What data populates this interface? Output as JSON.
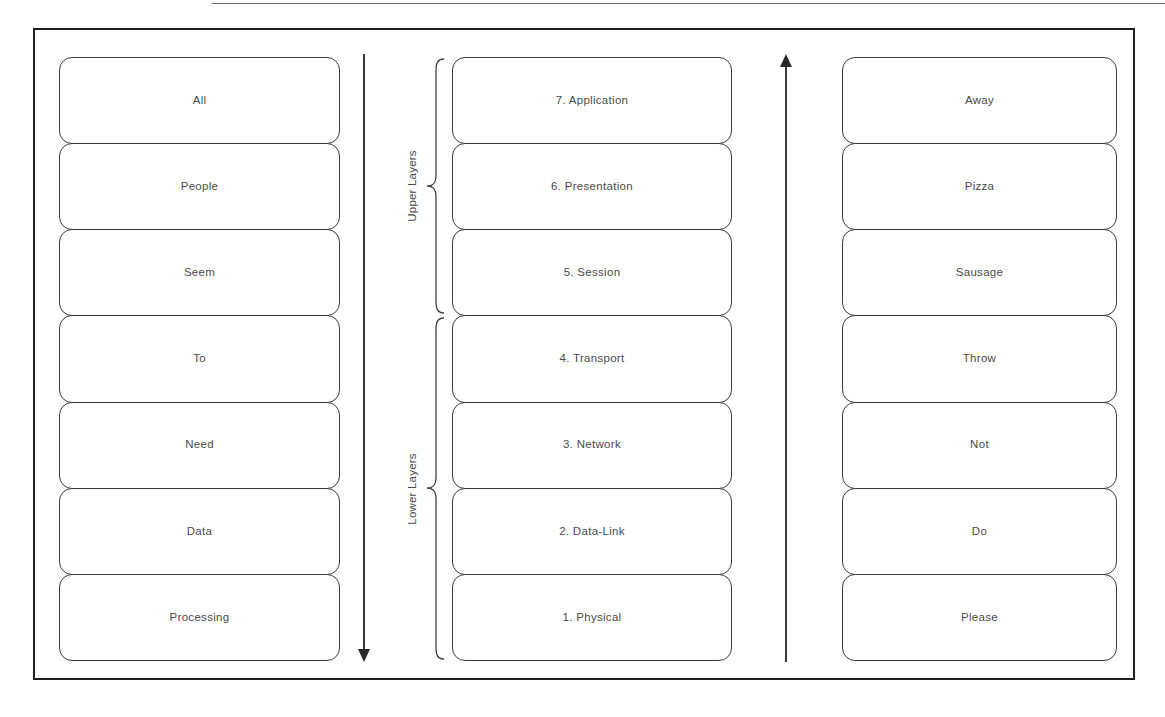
{
  "figure": {
    "type": "osi-model-mnemonic-diagram",
    "columns": {
      "left_mnemonic": {
        "name": "top-down-mnemonic",
        "items": [
          {
            "label": "All"
          },
          {
            "label": "People"
          },
          {
            "label": "Seem"
          },
          {
            "label": "To"
          },
          {
            "label": "Need"
          },
          {
            "label": "Data"
          },
          {
            "label": "Processing"
          }
        ]
      },
      "osi_layers": {
        "name": "osi-seven-layers",
        "items": [
          {
            "label": "7. Application"
          },
          {
            "label": "6. Presentation"
          },
          {
            "label": "5. Session"
          },
          {
            "label": "4. Transport"
          },
          {
            "label": "3. Network"
          },
          {
            "label": "2. Data-Link"
          },
          {
            "label": "1. Physical"
          }
        ]
      },
      "right_mnemonic": {
        "name": "bottom-up-mnemonic",
        "items": [
          {
            "label": "Away"
          },
          {
            "label": "Pizza"
          },
          {
            "label": "Sausage"
          },
          {
            "label": "Throw"
          },
          {
            "label": "Not"
          },
          {
            "label": "Do"
          },
          {
            "label": "Please"
          }
        ]
      }
    },
    "groups": [
      {
        "label": "Upper Layers",
        "covers": [
          "7. Application",
          "6. Presentation",
          "5. Session"
        ]
      },
      {
        "label": "Lower Layers",
        "covers": [
          "4. Transport",
          "3. Network",
          "2. Data-Link",
          "1. Physical"
        ]
      }
    ],
    "arrows": [
      {
        "name": "arrow-down-upper-to-lower",
        "direction": "down"
      },
      {
        "name": "arrow-up-lower-to-upper",
        "direction": "up"
      }
    ],
    "colors": {
      "frame": "#202020",
      "box_border": "#3a3a3a",
      "text": "#4a4a4a",
      "arrow": "#2a2a2a",
      "background": "#ffffff"
    }
  }
}
